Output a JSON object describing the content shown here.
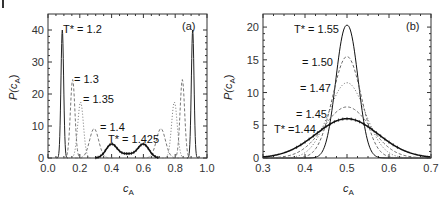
{
  "chart_data": [
    {
      "type": "line",
      "panel_label": "(a)",
      "xlabel": "c_A",
      "ylabel": "P(c_A)",
      "xlim": [
        0.0,
        1.0
      ],
      "ylim": [
        0,
        45
      ],
      "xticks": [
        "0.0",
        "0.2",
        "0.4",
        "0.6",
        "0.8",
        "1.0"
      ],
      "yticks": [
        "0",
        "10",
        "20",
        "30",
        "40"
      ],
      "grid": false,
      "series": [
        {
          "name": "T* = 1.2",
          "style": "solid",
          "peaks": [
            [
              0.09,
              40
            ],
            [
              0.91,
              40
            ]
          ]
        },
        {
          "name": "T* = 1.3",
          "style": "dashed",
          "peaks": [
            [
              0.155,
              24.5
            ],
            [
              0.845,
              24.5
            ]
          ]
        },
        {
          "name": "T* = 1.35",
          "style": "dotted",
          "peaks": [
            [
              0.205,
              17.5
            ],
            [
              0.795,
              17.5
            ]
          ]
        },
        {
          "name": "T* = 1.4",
          "style": "dashed",
          "peaks": [
            [
              0.29,
              9.2
            ],
            [
              0.71,
              9.2
            ]
          ]
        },
        {
          "name": "T* = 1.425",
          "style": "solid-markers",
          "peaks": [
            [
              0.4,
              4.3
            ],
            [
              0.6,
              4.3
            ]
          ],
          "valley": [
            0.5,
            2.0
          ]
        }
      ],
      "annotations": [
        "T* = 1.2",
        "= 1.3",
        "= 1.35",
        "= 1.4",
        "T* = 1.425"
      ]
    },
    {
      "type": "line",
      "panel_label": "(b)",
      "xlabel": "c_A",
      "ylabel": "P(c_A)",
      "xlim": [
        0.3,
        0.7
      ],
      "ylim": [
        0,
        22
      ],
      "xticks": [
        "0.3",
        "0.4",
        "0.5",
        "0.6",
        "0.7"
      ],
      "yticks": [
        "0",
        "5",
        "10",
        "15",
        "20"
      ],
      "grid": false,
      "series": [
        {
          "name": "T* = 1.55",
          "style": "solid",
          "peak": [
            0.5,
            20.3
          ],
          "half_width": 0.04
        },
        {
          "name": "T* = 1.50",
          "style": "dashed",
          "peak": [
            0.5,
            15.5
          ],
          "half_width": 0.055
        },
        {
          "name": "T* = 1.47",
          "style": "dotted",
          "peak": [
            0.5,
            11.5
          ],
          "half_width": 0.07
        },
        {
          "name": "T* = 1.45",
          "style": "dashed",
          "peak": [
            0.5,
            7.8
          ],
          "half_width": 0.09
        },
        {
          "name": "T* = 1.44",
          "style": "solid-markers",
          "peak": [
            0.5,
            6.0
          ],
          "half_width": 0.12
        }
      ],
      "annotations": [
        "T* = 1.55",
        "= 1.50",
        "= 1.47",
        "= 1.45",
        "T* =1.44"
      ]
    }
  ],
  "panels": {
    "a": {
      "label": "(a)",
      "xlabel": "c",
      "xlabel_sub": "A",
      "ylabel": "P(c",
      "ylabel_sub": "A",
      "ylabel_close": ")",
      "ann": {
        "t12": "T* = 1.2",
        "t13": "= 1.3",
        "t135": "= 1.35",
        "t14": "= 1.4",
        "t1425": "T* = 1.425"
      }
    },
    "b": {
      "label": "(b)",
      "xlabel": "c",
      "xlabel_sub": "A",
      "ylabel": "P(c",
      "ylabel_sub": "A",
      "ylabel_close": ")",
      "ann": {
        "t155": "T* = 1.55",
        "t150": "= 1.50",
        "t147": "= 1.47",
        "t145": "= 1.45",
        "t144": "T* =1.44"
      }
    }
  }
}
